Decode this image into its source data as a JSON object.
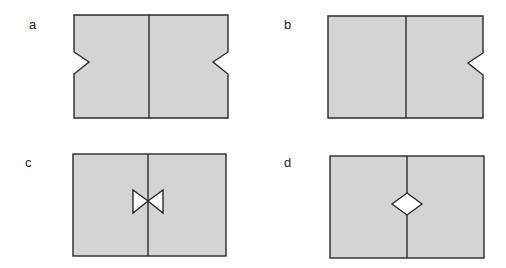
{
  "colors": {
    "fill": "#d4d4d4",
    "stroke": "#2a2a2a",
    "hole": "#ffffff"
  },
  "panels": [
    {
      "label": "a",
      "description": "Rectangle split by vertical line with V-notches on both left and right outer edges"
    },
    {
      "label": "b",
      "description": "Rectangle split by vertical line with a V-notch only on the right outer edge"
    },
    {
      "label": "c",
      "description": "Rectangle split by vertical line with a bow-tie shaped hole at the center of the dividing line"
    },
    {
      "label": "d",
      "description": "Rectangle split by vertical line with a diamond shaped hole at the center of the dividing line"
    }
  ]
}
